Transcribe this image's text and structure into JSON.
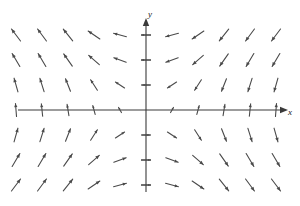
{
  "figure": {
    "type": "vector-field-plot",
    "background_color": "#ffffff",
    "width": 300,
    "height": 206
  },
  "axes": {
    "x_axis": {
      "label": "x",
      "label_x": 288,
      "label_y": 113,
      "line_color": "#3a3a3a",
      "y_pixel": 110,
      "x_start": 18,
      "x_end": 282,
      "arrowhead": "right"
    },
    "y_axis": {
      "label": "y",
      "label_x": 150,
      "label_y": 15,
      "line_color": "#3a3a3a",
      "x_pixel": 146,
      "y_start": 192,
      "y_end": 24,
      "arrowhead": "up"
    },
    "ticks": {
      "y_tick_values": [
        -3,
        -2,
        -1,
        1,
        2,
        3
      ],
      "y_tick_pixels": [
        185,
        160,
        135,
        85,
        60,
        35
      ],
      "tick_half_width": 5,
      "tick_color": "#3a3a3a"
    }
  },
  "chart_data": {
    "type": "scatter",
    "title": "",
    "xlabel": "x",
    "ylabel": "y",
    "grid": false,
    "legend": null,
    "field_description": "Clockwise rotational vector field; arrows reverse horizontal direction across the y-axis and reverse vertical direction across the x-axis",
    "arrow_color": "#4a4a4a",
    "arrow_stroke_width": 1.1,
    "origin_pixel": [
      146,
      110
    ],
    "x_spacing_pixel": 26,
    "y_spacing_pixel": 25,
    "columns_each_side": 5,
    "rows_each_side": 3,
    "arrow_scale": 13,
    "vectors": [
      {
        "col": -5,
        "row": 3,
        "dx": -0.72,
        "dy": 0.95
      },
      {
        "col": -4,
        "row": 3,
        "dx": -0.7,
        "dy": 0.95
      },
      {
        "col": -3,
        "row": 3,
        "dx": -0.74,
        "dy": 0.92
      },
      {
        "col": -2,
        "row": 3,
        "dx": -0.9,
        "dy": 0.62
      },
      {
        "col": -1,
        "row": 3,
        "dx": -0.99,
        "dy": 0.26
      },
      {
        "col": 1,
        "row": 3,
        "dx": -0.99,
        "dy": -0.26
      },
      {
        "col": 2,
        "row": 3,
        "dx": -0.9,
        "dy": -0.62
      },
      {
        "col": 3,
        "row": 3,
        "dx": -0.74,
        "dy": -0.92
      },
      {
        "col": 4,
        "row": 3,
        "dx": -0.7,
        "dy": -0.95
      },
      {
        "col": 5,
        "row": 3,
        "dx": -0.72,
        "dy": -0.95
      },
      {
        "col": -5,
        "row": 2,
        "dx": -0.6,
        "dy": 1.0
      },
      {
        "col": -4,
        "row": 2,
        "dx": -0.6,
        "dy": 1.0
      },
      {
        "col": -3,
        "row": 2,
        "dx": -0.66,
        "dy": 0.94
      },
      {
        "col": -2,
        "row": 2,
        "dx": -0.82,
        "dy": 0.72
      },
      {
        "col": -1,
        "row": 2,
        "dx": -0.95,
        "dy": 0.34
      },
      {
        "col": 1,
        "row": 2,
        "dx": -0.95,
        "dy": -0.34
      },
      {
        "col": 2,
        "row": 2,
        "dx": -0.82,
        "dy": -0.72
      },
      {
        "col": 3,
        "row": 2,
        "dx": -0.66,
        "dy": -0.94
      },
      {
        "col": 4,
        "row": 2,
        "dx": -0.6,
        "dy": -1.0
      },
      {
        "col": 5,
        "row": 2,
        "dx": -0.6,
        "dy": -1.0
      },
      {
        "col": -5,
        "row": 1,
        "dx": -0.3,
        "dy": 1.05
      },
      {
        "col": -4,
        "row": 1,
        "dx": -0.32,
        "dy": 1.02
      },
      {
        "col": -3,
        "row": 1,
        "dx": -0.38,
        "dy": 0.96
      },
      {
        "col": -2,
        "row": 1,
        "dx": -0.52,
        "dy": 0.8
      },
      {
        "col": -1,
        "row": 1,
        "dx": -0.7,
        "dy": 0.46
      },
      {
        "col": 1,
        "row": 1,
        "dx": -0.7,
        "dy": -0.46
      },
      {
        "col": 2,
        "row": 1,
        "dx": -0.52,
        "dy": -0.8
      },
      {
        "col": 3,
        "row": 1,
        "dx": -0.38,
        "dy": -0.96
      },
      {
        "col": 4,
        "row": 1,
        "dx": -0.32,
        "dy": -1.02
      },
      {
        "col": 5,
        "row": 1,
        "dx": -0.3,
        "dy": -1.05
      },
      {
        "col": -5,
        "row": 0,
        "dx": -0.08,
        "dy": 1.0
      },
      {
        "col": -4,
        "row": 0,
        "dx": -0.1,
        "dy": 0.96
      },
      {
        "col": -3,
        "row": 0,
        "dx": -0.14,
        "dy": 0.86
      },
      {
        "col": -2,
        "row": 0,
        "dx": -0.18,
        "dy": 0.68
      },
      {
        "col": -1,
        "row": 0,
        "dx": -0.22,
        "dy": 0.4
      },
      {
        "col": 1,
        "row": 0,
        "dx": 0.22,
        "dy": 0.4
      },
      {
        "col": 2,
        "row": 0,
        "dx": 0.18,
        "dy": 0.68
      },
      {
        "col": 3,
        "row": 0,
        "dx": 0.14,
        "dy": 0.86
      },
      {
        "col": 4,
        "row": 0,
        "dx": 0.1,
        "dy": 0.96
      },
      {
        "col": 5,
        "row": 0,
        "dx": 0.08,
        "dy": 1.0
      },
      {
        "col": -5,
        "row": -1,
        "dx": 0.3,
        "dy": 1.05
      },
      {
        "col": -4,
        "row": -1,
        "dx": 0.32,
        "dy": 1.02
      },
      {
        "col": -3,
        "row": -1,
        "dx": 0.38,
        "dy": 0.96
      },
      {
        "col": -2,
        "row": -1,
        "dx": 0.52,
        "dy": 0.8
      },
      {
        "col": -1,
        "row": -1,
        "dx": 0.7,
        "dy": 0.46
      },
      {
        "col": 1,
        "row": -1,
        "dx": 0.7,
        "dy": -0.46
      },
      {
        "col": 2,
        "row": -1,
        "dx": 0.52,
        "dy": -0.8
      },
      {
        "col": 3,
        "row": -1,
        "dx": 0.38,
        "dy": -0.96
      },
      {
        "col": 4,
        "row": -1,
        "dx": 0.32,
        "dy": -1.02
      },
      {
        "col": 5,
        "row": -1,
        "dx": 0.3,
        "dy": -1.05
      },
      {
        "col": -5,
        "row": -2,
        "dx": 0.6,
        "dy": 1.0
      },
      {
        "col": -4,
        "row": -2,
        "dx": 0.6,
        "dy": 1.0
      },
      {
        "col": -3,
        "row": -2,
        "dx": 0.66,
        "dy": 0.94
      },
      {
        "col": -2,
        "row": -2,
        "dx": 0.82,
        "dy": 0.72
      },
      {
        "col": -1,
        "row": -2,
        "dx": 0.95,
        "dy": 0.34
      },
      {
        "col": 1,
        "row": -2,
        "dx": 0.95,
        "dy": -0.34
      },
      {
        "col": 2,
        "row": -2,
        "dx": 0.82,
        "dy": -0.72
      },
      {
        "col": 3,
        "row": -2,
        "dx": 0.66,
        "dy": -0.94
      },
      {
        "col": 4,
        "row": -2,
        "dx": 0.6,
        "dy": -1.0
      },
      {
        "col": 5,
        "row": -2,
        "dx": 0.6,
        "dy": -1.0
      },
      {
        "col": -5,
        "row": -3,
        "dx": 0.72,
        "dy": 0.95
      },
      {
        "col": -4,
        "row": -3,
        "dx": 0.7,
        "dy": 0.95
      },
      {
        "col": -3,
        "row": -3,
        "dx": 0.74,
        "dy": 0.92
      },
      {
        "col": -2,
        "row": -3,
        "dx": 0.9,
        "dy": 0.62
      },
      {
        "col": -1,
        "row": -3,
        "dx": 0.99,
        "dy": 0.26
      },
      {
        "col": 1,
        "row": -3,
        "dx": 0.99,
        "dy": -0.26
      },
      {
        "col": 2,
        "row": -3,
        "dx": 0.9,
        "dy": -0.62
      },
      {
        "col": 3,
        "row": -3,
        "dx": 0.74,
        "dy": -0.92
      },
      {
        "col": 4,
        "row": -3,
        "dx": 0.7,
        "dy": -0.95
      },
      {
        "col": 5,
        "row": -3,
        "dx": 0.72,
        "dy": -0.95
      }
    ],
    "axis_vectors": [
      {
        "x_pixel": 146,
        "y_pixel": 35,
        "dx": -1.0,
        "dy": 0.0,
        "len": 9
      },
      {
        "x_pixel": 146,
        "y_pixel": 60,
        "dx": -1.0,
        "dy": 0.0,
        "len": 9
      },
      {
        "x_pixel": 146,
        "y_pixel": 85,
        "dx": -1.0,
        "dy": 0.0,
        "len": 7
      },
      {
        "x_pixel": 146,
        "y_pixel": 135,
        "dx": 1.0,
        "dy": 0.0,
        "len": 7
      },
      {
        "x_pixel": 146,
        "y_pixel": 160,
        "dx": 1.0,
        "dy": 0.0,
        "len": 9
      },
      {
        "x_pixel": 146,
        "y_pixel": 185,
        "dx": 1.0,
        "dy": 0.0,
        "len": 9
      }
    ]
  }
}
